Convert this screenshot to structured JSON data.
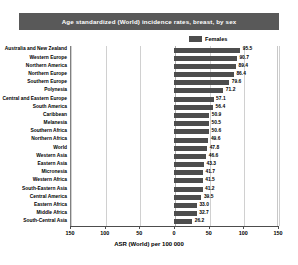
{
  "chart_data": {
    "type": "bar",
    "title": "Age standardized (World) incidence rates, breast, by sex",
    "xlabel": "ASR (World) per 100 000",
    "ylabel": "",
    "orientation": "horizontal",
    "grid": true,
    "legend_position": "top-right",
    "xlim": [
      -150,
      150
    ],
    "xticks": [
      150,
      100,
      50,
      0,
      50,
      100,
      150
    ],
    "xtick_labels": [
      "150",
      "100",
      "50",
      "0",
      "50",
      "100",
      "150"
    ],
    "legend": [
      {
        "name": "Females",
        "color": "#4d4d4d"
      }
    ],
    "categories": [
      "Australia and New Zealand",
      "Western Europe",
      "Northern America",
      "Northern Europe",
      "Southern Europe",
      "Polynesia",
      "Central and Eastern Europe",
      "South America",
      "Caribbean",
      "Melanesia",
      "Southern Africa",
      "Northern Africa",
      "World",
      "Western Asia",
      "Eastern Asia",
      "Micronesia",
      "Western Africa",
      "South-Eastern Asia",
      "Central America",
      "Eastern Africa",
      "Middle Africa",
      "South-Central Asia"
    ],
    "series": [
      {
        "name": "Females",
        "color": "#4d4d4d",
        "values": [
          95.5,
          90.7,
          89.4,
          86.4,
          79.6,
          71.2,
          57.1,
          56.4,
          50.9,
          50.5,
          50.6,
          49.6,
          47.8,
          46.6,
          43.3,
          41.7,
          41.5,
          41.2,
          39.5,
          33.0,
          32.7,
          26.2
        ]
      }
    ],
    "value_labels": [
      "95.5",
      "90.7",
      "89.4",
      "86.4",
      "79.6",
      "71.2",
      "57.1",
      "56.4",
      "50.9",
      "50.5",
      "50.6",
      "49.6",
      "47.8",
      "46.6",
      "43.3",
      "41.7",
      "41.5",
      "41.2",
      "39.5",
      "33.0",
      "32.7",
      "26.2"
    ]
  }
}
